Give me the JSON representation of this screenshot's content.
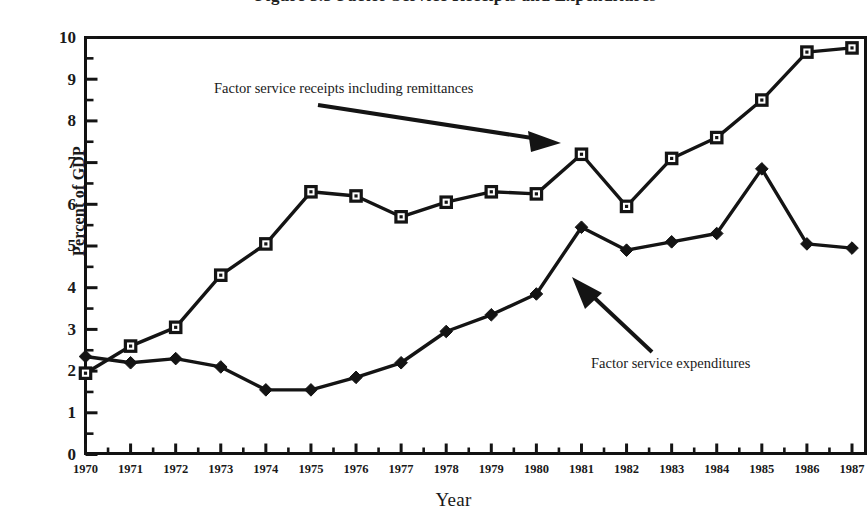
{
  "figure": {
    "title_partial": "Figure 3.3 Factor Service Receipts and Expenditures",
    "xaxis_title": "Year",
    "yaxis_title": "Percent of GDP"
  },
  "annotations": {
    "receipts": "Factor service receipts including remittances",
    "expenditures": "Factor service expenditures"
  },
  "yticks": [
    "10",
    "9",
    "8",
    "7",
    "6",
    "5",
    "4",
    "3",
    "2",
    "1",
    "0"
  ],
  "xticks": [
    "1970",
    "1971",
    "1972",
    "1973",
    "1974",
    "1975",
    "1976",
    "1977",
    "1978",
    "1979",
    "1980",
    "1981",
    "1982",
    "1983",
    "1984",
    "1985",
    "1986",
    "1987"
  ],
  "colors": {
    "ink": "#141414",
    "background": "#ffffff"
  },
  "chart_data": {
    "type": "line",
    "title": "Figure 3.3 Factor Service Receipts and Expenditures",
    "xlabel": "Year",
    "ylabel": "Percent of GDP",
    "xlim": [
      1970,
      1987
    ],
    "ylim": [
      0,
      10
    ],
    "grid": false,
    "legend": "annotated-inline",
    "x": [
      1970,
      1971,
      1972,
      1973,
      1974,
      1975,
      1976,
      1977,
      1978,
      1979,
      1980,
      1981,
      1982,
      1983,
      1984,
      1985,
      1986,
      1987
    ],
    "series": [
      {
        "name": "Factor service receipts including remittances",
        "marker": "open-square",
        "values": [
          1.95,
          2.6,
          3.05,
          4.3,
          5.05,
          6.3,
          6.2,
          5.7,
          6.05,
          6.3,
          6.25,
          7.2,
          5.95,
          7.1,
          7.6,
          8.5,
          9.65,
          9.75
        ]
      },
      {
        "name": "Factor service expenditures",
        "marker": "filled-diamond",
        "values": [
          2.35,
          2.2,
          2.3,
          2.1,
          1.55,
          1.55,
          1.85,
          2.2,
          2.95,
          3.35,
          3.85,
          5.45,
          4.9,
          5.1,
          5.3,
          6.85,
          5.05,
          4.95
        ]
      }
    ]
  }
}
